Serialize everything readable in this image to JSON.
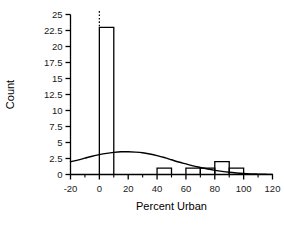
{
  "chart_data": {
    "type": "bar",
    "title": "",
    "xlabel": "Percent Urban",
    "ylabel": "Count",
    "xlim": [
      -20,
      120
    ],
    "ylim": [
      0,
      25
    ],
    "grid": false,
    "legend": null,
    "bin_width": 10,
    "categories": [
      "0-10",
      "40-50",
      "60-70",
      "70-80",
      "80-90",
      "90-100"
    ],
    "values": [
      23,
      1,
      1,
      1,
      2,
      1
    ],
    "bins": [
      {
        "x0": 0,
        "x1": 10,
        "count": 23,
        "clipped": true
      },
      {
        "x0": 40,
        "x1": 50,
        "count": 1,
        "clipped": false
      },
      {
        "x0": 60,
        "x1": 70,
        "count": 1,
        "clipped": false
      },
      {
        "x0": 70,
        "x1": 80,
        "count": 1,
        "clipped": false
      },
      {
        "x0": 80,
        "x1": 90,
        "count": 2,
        "clipped": false
      },
      {
        "x0": 90,
        "x1": 100,
        "count": 1,
        "clipped": false
      }
    ],
    "xticks": [
      -20,
      0,
      20,
      40,
      60,
      80,
      100,
      120
    ],
    "xtick_labels": [
      "-20",
      "0",
      "20",
      "40",
      "60",
      "80",
      "100",
      "120"
    ],
    "xticks_minor": [
      -10,
      10,
      30,
      50,
      70,
      90,
      110
    ],
    "yticks": [
      0,
      2.5,
      5,
      7.5,
      10,
      12.5,
      15,
      17.5,
      20,
      22.5,
      25
    ],
    "ytick_labels": [
      "0",
      "2.5",
      "5",
      "7.5",
      "10",
      "12.5",
      "15",
      "17.5",
      "20",
      "22.5",
      "25"
    ],
    "overlay_curve": {
      "name": "normal-density-overlay",
      "points": [
        {
          "x": -20,
          "y": 2.0
        },
        {
          "x": -15,
          "y": 2.25
        },
        {
          "x": -10,
          "y": 2.55
        },
        {
          "x": -5,
          "y": 2.85
        },
        {
          "x": 0,
          "y": 3.1
        },
        {
          "x": 5,
          "y": 3.3
        },
        {
          "x": 10,
          "y": 3.45
        },
        {
          "x": 15,
          "y": 3.55
        },
        {
          "x": 20,
          "y": 3.55
        },
        {
          "x": 25,
          "y": 3.5
        },
        {
          "x": 30,
          "y": 3.4
        },
        {
          "x": 35,
          "y": 3.2
        },
        {
          "x": 40,
          "y": 2.95
        },
        {
          "x": 45,
          "y": 2.65
        },
        {
          "x": 50,
          "y": 2.3
        },
        {
          "x": 55,
          "y": 1.95
        },
        {
          "x": 60,
          "y": 1.65
        },
        {
          "x": 65,
          "y": 1.35
        },
        {
          "x": 70,
          "y": 1.1
        },
        {
          "x": 75,
          "y": 0.85
        },
        {
          "x": 80,
          "y": 0.65
        },
        {
          "x": 85,
          "y": 0.48
        },
        {
          "x": 90,
          "y": 0.34
        },
        {
          "x": 95,
          "y": 0.24
        },
        {
          "x": 100,
          "y": 0.16
        },
        {
          "x": 105,
          "y": 0.1
        },
        {
          "x": 110,
          "y": 0.06
        },
        {
          "x": 115,
          "y": 0.03
        },
        {
          "x": 120,
          "y": 0.02
        }
      ]
    },
    "colors": {
      "axis": "#000000",
      "bar_stroke": "#000000",
      "bar_fill": "#ffffff",
      "curve": "#000000",
      "background": "#ffffff"
    }
  }
}
